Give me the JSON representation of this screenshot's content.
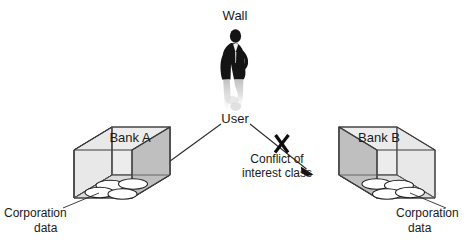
{
  "diagram": {
    "title_label": "Wall",
    "user_label": "User",
    "conflict_label_line1": "Conflict of",
    "conflict_label_line2": "interest class",
    "banks": [
      {
        "id": "bank-a",
        "label": "Bank A",
        "data_label_line1": "Corporation",
        "data_label_line2": "data",
        "access": "allowed",
        "disc_count": 4
      },
      {
        "id": "bank-b",
        "label": "Bank B",
        "data_label_line1": "Corporation",
        "data_label_line2": "data",
        "access": "blocked",
        "disc_count": 4
      }
    ],
    "icons": {
      "person": "person-silhouette-icon",
      "block": "x-block-icon",
      "arrow_left": "arrow-to-bank-a-icon",
      "arrow_right": "arrow-to-bank-b-icon"
    },
    "colors": {
      "background": "#ffffff",
      "text": "#1a1a1a",
      "edge": "#3a3a3a",
      "face_light": "#e3e3e3",
      "face_mid": "#d2d2d2",
      "face_dark": "#b9b9b9",
      "floor": "#dcdcdc",
      "person": "#141414",
      "person_reflection": "#c9c9c9",
      "disc_fill": "#ffffff",
      "block_mark": "#0d0d0d"
    }
  }
}
